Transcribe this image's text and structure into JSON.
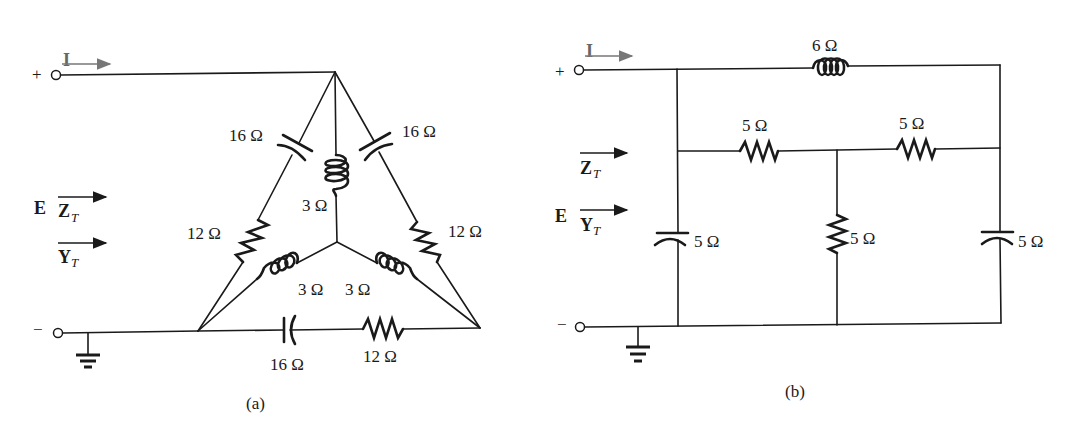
{
  "figure": {
    "panels": [
      {
        "id": "a",
        "caption": "(a)",
        "terminals": {
          "plus": "+",
          "minus": "−"
        },
        "current_label": "I",
        "source_label": "E",
        "impedance_label": "Z",
        "impedance_sub": "T",
        "admittance_label": "Y",
        "admittance_sub": "T",
        "components": {
          "delta_left_capacitor": "16 Ω",
          "delta_left_resistor": "12 Ω",
          "delta_right_capacitor": "16 Ω",
          "delta_right_resistor": "12 Ω",
          "delta_bottom_capacitor": "16 Ω",
          "delta_bottom_resistor": "12 Ω",
          "wye_top_inductor": "3 Ω",
          "wye_left_inductor": "3 Ω",
          "wye_right_inductor": "3 Ω"
        }
      },
      {
        "id": "b",
        "caption": "(b)",
        "terminals": {
          "plus": "+",
          "minus": "−"
        },
        "current_label": "I",
        "source_label": "E",
        "impedance_label": "Z",
        "impedance_sub": "T",
        "admittance_label": "Y",
        "admittance_sub": "T",
        "components": {
          "top_inductor": "6 Ω",
          "middle_left_resistor": "5 Ω",
          "middle_right_resistor": "5 Ω",
          "left_capacitor": "5 Ω",
          "center_resistor": "5 Ω",
          "right_capacitor": "5 Ω"
        }
      }
    ]
  }
}
